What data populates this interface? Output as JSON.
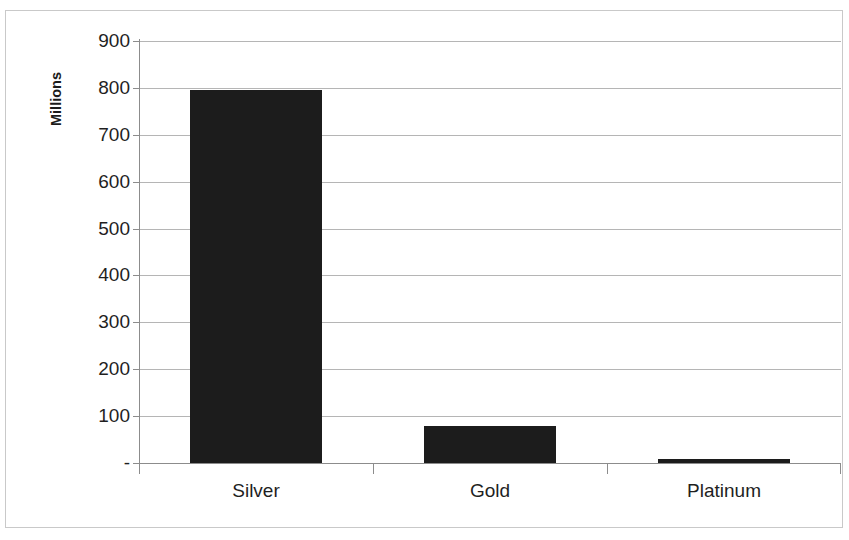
{
  "chart_data": {
    "type": "bar",
    "title": "",
    "subtitle": "",
    "xlabel": "",
    "ylabel": "Millions",
    "categories": [
      "Silver",
      "Gold",
      "Platinum"
    ],
    "values": [
      795,
      78,
      8
    ],
    "series": [
      {
        "name": "Annual supply",
        "values": [
          795,
          78,
          8
        ]
      }
    ],
    "ylim": [
      0,
      900
    ],
    "ytick_values": [
      0,
      100,
      200,
      300,
      400,
      500,
      600,
      700,
      800,
      900
    ],
    "ytick_labels": [
      "-",
      "100",
      "200",
      "300",
      "400",
      "500",
      "600",
      "700",
      "800",
      "900"
    ],
    "grid": true,
    "grid_axis": "y",
    "legend": false,
    "legend_position": "none",
    "bar_color": "#1c1c1c",
    "gridline_color": "#b5b5b5",
    "axis_color": "#8c8c8c",
    "background_color": "#ffffff",
    "border_color": "#c9c9c9",
    "annotations": []
  }
}
